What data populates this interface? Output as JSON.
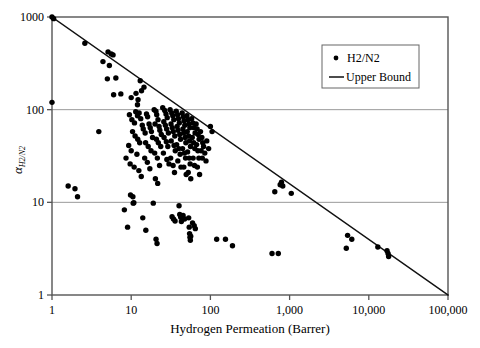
{
  "chart_data": {
    "type": "scatter",
    "title": "",
    "xlabel": "Hydrogen Permeation (Barrer)",
    "ylabel": "a_H2/N2",
    "ylabel_base": "α",
    "ylabel_sub": "H2/N2",
    "xscale": "log",
    "yscale": "log",
    "xlim": [
      1,
      100000
    ],
    "ylim": [
      1,
      1000
    ],
    "xticks": [
      1,
      10,
      100,
      1000,
      10000,
      100000
    ],
    "xticklabels": [
      "1",
      "10",
      "100",
      "1,000",
      "10,000",
      "100,000"
    ],
    "yticks": [
      1,
      10,
      100,
      1000
    ],
    "yticklabels": [
      "1",
      "10",
      "100",
      "1000"
    ],
    "grid": "horizontal-at-10-and-100",
    "legend_position": "top-right-inside",
    "legend": [
      {
        "label": "H2/N2",
        "marker": "dot",
        "color": "#000000"
      },
      {
        "label": "Upper Bound",
        "marker": "line",
        "color": "#111111"
      }
    ],
    "series": [
      {
        "name": "H2/N2",
        "marker": "dot",
        "color": "#000000",
        "points": [
          [
            1.0,
            1000
          ],
          [
            1.05,
            960
          ],
          [
            1.0,
            120
          ],
          [
            1.6,
            15
          ],
          [
            1.95,
            14
          ],
          [
            2.1,
            11.5
          ],
          [
            3.9,
            58
          ],
          [
            2.6,
            520
          ],
          [
            4.4,
            330
          ],
          [
            5.3,
            300
          ],
          [
            5.0,
            215
          ],
          [
            6.4,
            220
          ],
          [
            5.1,
            420
          ],
          [
            5.6,
            400
          ],
          [
            5.9,
            390
          ],
          [
            6.0,
            145
          ],
          [
            7.4,
            148
          ],
          [
            8.2,
            8.3
          ],
          [
            9.0,
            5.4
          ],
          [
            9.8,
            12.0
          ],
          [
            10.5,
            11.5
          ],
          [
            10.6,
            9.8
          ],
          [
            10.8,
            9.9
          ],
          [
            10.0,
            135
          ],
          [
            11.5,
            150
          ],
          [
            12.2,
            128
          ],
          [
            12.0,
            113
          ],
          [
            13.0,
            205
          ],
          [
            13.5,
            160
          ],
          [
            14.5,
            175
          ],
          [
            9.5,
            88
          ],
          [
            10.2,
            78
          ],
          [
            11.0,
            72
          ],
          [
            11.4,
            95
          ],
          [
            12.0,
            86
          ],
          [
            12.6,
            92
          ],
          [
            13.2,
            80
          ],
          [
            13.8,
            68
          ],
          [
            10.4,
            58
          ],
          [
            11.2,
            52
          ],
          [
            12.1,
            48
          ],
          [
            12.8,
            44
          ],
          [
            9.3,
            41
          ],
          [
            10.0,
            36
          ],
          [
            11.8,
            33
          ],
          [
            8.6,
            30
          ],
          [
            9.7,
            26
          ],
          [
            10.9,
            24
          ],
          [
            12.5,
            22
          ],
          [
            13.4,
            19
          ],
          [
            14.2,
            62
          ],
          [
            15.0,
            56
          ],
          [
            15.6,
            90
          ],
          [
            16.1,
            84
          ],
          [
            16.8,
            70
          ],
          [
            17.4,
            64
          ],
          [
            18.0,
            58
          ],
          [
            18.6,
            50
          ],
          [
            15.2,
            44
          ],
          [
            16.4,
            40
          ],
          [
            17.8,
            36
          ],
          [
            14.8,
            30
          ],
          [
            16.0,
            27
          ],
          [
            17.2,
            23
          ],
          [
            14.0,
            6.8
          ],
          [
            15.3,
            5.0
          ],
          [
            19.5,
            100
          ],
          [
            20.5,
            96
          ],
          [
            21.0,
            88
          ],
          [
            21.8,
            78
          ],
          [
            20.0,
            70
          ],
          [
            22.5,
            66
          ],
          [
            23.0,
            60
          ],
          [
            24.0,
            54
          ],
          [
            20.8,
            48
          ],
          [
            22.0,
            44
          ],
          [
            23.6,
            40
          ],
          [
            19.8,
            34
          ],
          [
            21.4,
            30
          ],
          [
            22.8,
            25
          ],
          [
            20.2,
            18
          ],
          [
            21.6,
            16
          ],
          [
            19.0,
            9.8
          ],
          [
            20.6,
            4.0
          ],
          [
            21.2,
            3.6
          ],
          [
            25.0,
            105
          ],
          [
            26.5,
            98
          ],
          [
            27.5,
            90
          ],
          [
            28.5,
            82
          ],
          [
            25.8,
            74
          ],
          [
            27.0,
            68
          ],
          [
            28.0,
            62
          ],
          [
            29.5,
            56
          ],
          [
            26.0,
            50
          ],
          [
            27.8,
            45
          ],
          [
            29.0,
            40
          ],
          [
            25.5,
            34
          ],
          [
            28.2,
            29
          ],
          [
            30.0,
            26
          ],
          [
            31.0,
            100
          ],
          [
            32.5,
            92
          ],
          [
            33.5,
            86
          ],
          [
            34.5,
            78
          ],
          [
            31.8,
            70
          ],
          [
            33.0,
            64
          ],
          [
            34.0,
            58
          ],
          [
            35.5,
            52
          ],
          [
            32.0,
            46
          ],
          [
            34.8,
            41
          ],
          [
            36.0,
            36
          ],
          [
            31.5,
            30
          ],
          [
            33.8,
            25
          ],
          [
            35.2,
            21
          ],
          [
            32.8,
            7.0
          ],
          [
            34.2,
            6.6
          ],
          [
            35.8,
            6.3
          ],
          [
            37.0,
            96
          ],
          [
            38.5,
            88
          ],
          [
            39.5,
            80
          ],
          [
            40.5,
            72
          ],
          [
            38.0,
            66
          ],
          [
            39.0,
            60
          ],
          [
            41.0,
            54
          ],
          [
            42.0,
            48
          ],
          [
            37.5,
            42
          ],
          [
            40.0,
            38
          ],
          [
            41.5,
            33
          ],
          [
            38.8,
            28
          ],
          [
            42.5,
            24
          ],
          [
            40.2,
            9.2
          ],
          [
            41.0,
            7.4
          ],
          [
            42.2,
            6.9
          ],
          [
            43.0,
            6.2
          ],
          [
            44.0,
            92
          ],
          [
            45.5,
            84
          ],
          [
            46.5,
            76
          ],
          [
            47.5,
            68
          ],
          [
            45.0,
            62
          ],
          [
            46.0,
            56
          ],
          [
            48.0,
            50
          ],
          [
            49.0,
            44
          ],
          [
            44.5,
            38
          ],
          [
            47.0,
            34
          ],
          [
            48.5,
            30
          ],
          [
            46.2,
            24
          ],
          [
            49.5,
            20
          ],
          [
            45.2,
            7.2
          ],
          [
            47.2,
            6.6
          ],
          [
            50.5,
            86
          ],
          [
            52.0,
            78
          ],
          [
            53.5,
            70
          ],
          [
            55.0,
            64
          ],
          [
            51.0,
            58
          ],
          [
            53.0,
            52
          ],
          [
            54.5,
            46
          ],
          [
            56.0,
            40
          ],
          [
            51.5,
            35
          ],
          [
            54.0,
            30
          ],
          [
            55.5,
            26
          ],
          [
            52.5,
            21
          ],
          [
            56.5,
            18
          ],
          [
            53.2,
            6.8
          ],
          [
            54.0,
            5.4
          ],
          [
            54.6,
            4.6
          ],
          [
            55.2,
            4.2
          ],
          [
            55.8,
            3.9
          ],
          [
            56.4,
            4.3
          ],
          [
            58.0,
            80
          ],
          [
            60.0,
            72
          ],
          [
            62.0,
            64
          ],
          [
            64.0,
            56
          ],
          [
            59.0,
            50
          ],
          [
            61.5,
            44
          ],
          [
            63.5,
            38
          ],
          [
            60.5,
            30
          ],
          [
            63.0,
            25
          ],
          [
            59.5,
            6.0
          ],
          [
            62.5,
            5.6
          ],
          [
            64.5,
            5.2
          ],
          [
            66.0,
            70
          ],
          [
            68.0,
            62
          ],
          [
            70.0,
            54
          ],
          [
            72.0,
            48
          ],
          [
            67.0,
            42
          ],
          [
            69.5,
            36
          ],
          [
            71.5,
            30
          ],
          [
            68.5,
            24
          ],
          [
            73.0,
            20
          ],
          [
            75.0,
            58
          ],
          [
            78.0,
            50
          ],
          [
            80.0,
            44
          ],
          [
            76.5,
            36
          ],
          [
            79.0,
            30
          ],
          [
            82.0,
            40
          ],
          [
            85.0,
            34
          ],
          [
            88.0,
            28
          ],
          [
            90.0,
            46
          ],
          [
            95.0,
            38
          ],
          [
            100.0,
            66
          ],
          [
            105.0,
            58
          ],
          [
            120.0,
            4.0
          ],
          [
            155.0,
            4.0
          ],
          [
            190.0,
            3.4
          ],
          [
            650.0,
            13.0
          ],
          [
            760.0,
            15.5
          ],
          [
            790.0,
            16.5
          ],
          [
            820.0,
            15.0
          ],
          [
            1050.0,
            12.5
          ],
          [
            600.0,
            2.8
          ],
          [
            720.0,
            2.8
          ],
          [
            5200.0,
            3.2
          ],
          [
            5400.0,
            4.4
          ],
          [
            6100.0,
            4.0
          ],
          [
            13000.0,
            3.3
          ],
          [
            17000.0,
            3.0
          ],
          [
            17500.0,
            2.8
          ],
          [
            17800.0,
            2.6
          ]
        ]
      }
    ],
    "upper_bound": {
      "name": "Upper Bound",
      "type": "line",
      "endpoints": [
        [
          1,
          1000
        ],
        [
          100000,
          1
        ]
      ]
    }
  }
}
